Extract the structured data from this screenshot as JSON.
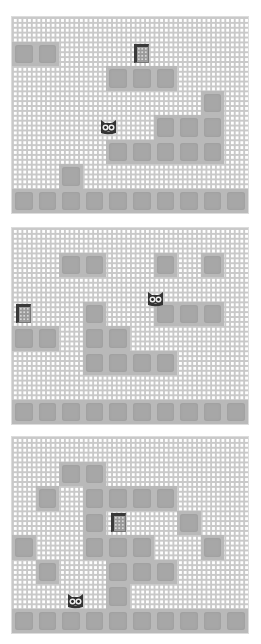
{
  "game": {
    "grid_cols": 10,
    "grid_rows": 8,
    "colors": {
      "background_grid_line": "#c9c9c9",
      "background": "#ffffff",
      "block_border": "#b9b9b9",
      "block_fill": "#a7a7a7",
      "goal_frame": "#3a3a3a",
      "cat": "#333333"
    },
    "icons": {
      "player": "cat-face-icon",
      "goal": "door-goal-icon",
      "block": "stone-block"
    },
    "levels": [
      {
        "name": "level-1",
        "blocks": [
          [
            1,
            0
          ],
          [
            1,
            1
          ],
          [
            2,
            4
          ],
          [
            2,
            5
          ],
          [
            2,
            6
          ],
          [
            3,
            8
          ],
          [
            4,
            6
          ],
          [
            4,
            7
          ],
          [
            4,
            8
          ],
          [
            5,
            4
          ],
          [
            5,
            5
          ],
          [
            5,
            6
          ],
          [
            5,
            7
          ],
          [
            5,
            8
          ],
          [
            6,
            2
          ],
          [
            7,
            0
          ],
          [
            7,
            1
          ],
          [
            7,
            2
          ],
          [
            7,
            3
          ],
          [
            7,
            4
          ],
          [
            7,
            5
          ],
          [
            7,
            6
          ],
          [
            7,
            7
          ],
          [
            7,
            8
          ],
          [
            7,
            9
          ]
        ],
        "goal": [
          1,
          5
        ],
        "cat": [
          4,
          3.6
        ]
      },
      {
        "name": "level-2",
        "blocks": [
          [
            1,
            2
          ],
          [
            1,
            3
          ],
          [
            1,
            6
          ],
          [
            1,
            8
          ],
          [
            3,
            3
          ],
          [
            3,
            6
          ],
          [
            3,
            7
          ],
          [
            3,
            8
          ],
          [
            4,
            0
          ],
          [
            4,
            1
          ],
          [
            4,
            3
          ],
          [
            4,
            4
          ],
          [
            5,
            3
          ],
          [
            5,
            4
          ],
          [
            5,
            5
          ],
          [
            5,
            6
          ],
          [
            7,
            0
          ],
          [
            7,
            1
          ],
          [
            7,
            2
          ],
          [
            7,
            3
          ],
          [
            7,
            4
          ],
          [
            7,
            5
          ],
          [
            7,
            6
          ],
          [
            7,
            7
          ],
          [
            7,
            8
          ],
          [
            7,
            9
          ]
        ],
        "goal": [
          3,
          0
        ],
        "cat": [
          2.4,
          5.6
        ]
      },
      {
        "name": "level-3",
        "blocks": [
          [
            1,
            2
          ],
          [
            1,
            3
          ],
          [
            2,
            1
          ],
          [
            2,
            3
          ],
          [
            2,
            4
          ],
          [
            2,
            5
          ],
          [
            2,
            6
          ],
          [
            3,
            3
          ],
          [
            3,
            7
          ],
          [
            4,
            0
          ],
          [
            4,
            3
          ],
          [
            4,
            4
          ],
          [
            4,
            5
          ],
          [
            4,
            8
          ],
          [
            5,
            1
          ],
          [
            5,
            4
          ],
          [
            5,
            5
          ],
          [
            5,
            6
          ],
          [
            6,
            4
          ],
          [
            7,
            0
          ],
          [
            7,
            1
          ],
          [
            7,
            2
          ],
          [
            7,
            3
          ],
          [
            7,
            4
          ],
          [
            7,
            5
          ],
          [
            7,
            6
          ],
          [
            7,
            7
          ],
          [
            7,
            8
          ],
          [
            7,
            9
          ]
        ],
        "goal": [
          3,
          4
        ],
        "cat": [
          6.2,
          2.2
        ]
      }
    ]
  }
}
